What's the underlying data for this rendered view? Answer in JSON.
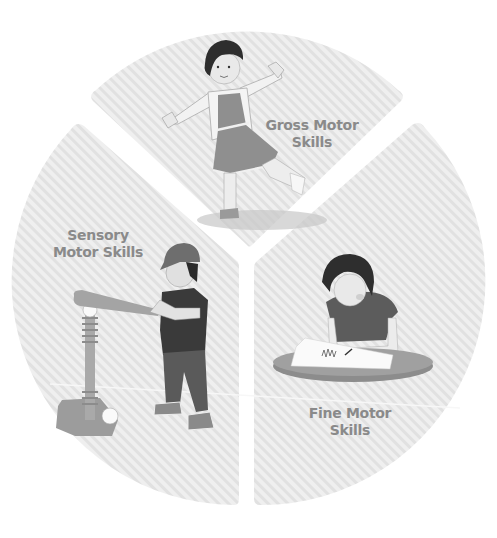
{
  "diagram": {
    "type": "exploded-pie",
    "title": "",
    "segments": [
      {
        "id": "gross",
        "label_line1": "Gross Motor",
        "label_line2": "Skills",
        "illustration": "girl balancing on one leg with arms outstretched"
      },
      {
        "id": "fine",
        "label_line1": "Fine Motor",
        "label_line2": "Skills",
        "illustration": "child drawing on paper at a round table"
      },
      {
        "id": "sensory",
        "label_line1": "Sensory",
        "label_line2": "Motor Skills",
        "illustration": "boy in cap swinging bat at a tee-ball stand"
      }
    ],
    "colors": {
      "background": "#ffffff",
      "slice_base": "#efefef",
      "slice_stripe": "#e0e0e0",
      "label": "#8a8a8a",
      "hair": "#2e2e2e",
      "shirt_dark": "#3a3a3a",
      "skin": "#e6e6e6",
      "dress": "#8f8f8f",
      "table": "#8c8c8c",
      "paper": "#fafafa",
      "cap": "#6e6e6e",
      "pants": "#5a5a5a",
      "bat": "#a4a4a4",
      "tee": "#a0a0a0"
    }
  }
}
